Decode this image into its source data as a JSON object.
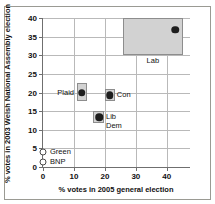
{
  "chart_data": {
    "type": "scatter",
    "title": "",
    "xlabel": "% votes in 2005 general election",
    "ylabel": "% votes in 2003 Welsh National Assembly election",
    "xlim": [
      0,
      47.5
    ],
    "ylim": [
      0,
      40
    ],
    "xticks": [
      "0",
      "10",
      "20",
      "30",
      "40"
    ],
    "xtick_values": [
      0,
      10,
      20,
      30,
      40
    ],
    "yticks": [
      "0",
      "5",
      "10",
      "15",
      "20",
      "25",
      "30",
      "35",
      "40"
    ],
    "ytick_values": [
      0,
      5,
      10,
      15,
      20,
      25,
      30,
      35,
      40
    ],
    "grid": "horizontal-and-vertical",
    "legend": "none",
    "points": [
      {
        "name": "Lab",
        "label": "Lab",
        "x": 42.7,
        "y": 36.9,
        "marker": "filled-circle",
        "band": {
          "x0": 25.8,
          "x1": 45.2,
          "y0": 30.0,
          "y1": 40.0
        },
        "label_pos": "below-band"
      },
      {
        "name": "Plaid",
        "label": "Plaid",
        "x": 12.6,
        "y": 20.0,
        "marker": "filled-circle",
        "band": {
          "x0": 10.9,
          "x1": 14.3,
          "y0": 17.6,
          "y1": 22.6
        },
        "label_pos": "left"
      },
      {
        "name": "Con",
        "label": "Con",
        "x": 21.6,
        "y": 19.3,
        "marker": "filled-circle",
        "band": {
          "x0": 20.0,
          "x1": 23.3,
          "y0": 17.6,
          "y1": 21.0
        },
        "label_pos": "right"
      },
      {
        "name": "Lib Dem",
        "label": "Lib\nDem",
        "label_line1": "Lib",
        "label_line2": "Dem",
        "x": 18.1,
        "y": 13.4,
        "marker": "filled-circle",
        "band": {
          "x0": 16.3,
          "x1": 19.8,
          "y0": 11.7,
          "y1": 15.1
        },
        "label_pos": "right"
      },
      {
        "name": "Green",
        "label": "Green",
        "x": 0.0,
        "y": 4.0,
        "marker": "open-circle",
        "band": null,
        "label_pos": "right"
      },
      {
        "name": "BNP",
        "label": "BNP",
        "x": 0.0,
        "y": 1.4,
        "marker": "open-circle",
        "band": null,
        "label_pos": "right"
      }
    ],
    "colors": {
      "band_fill": "#d2d2d2",
      "band_stroke": "#8d8d8d",
      "dot": "#1d1d1d",
      "grid": "#b9b9b9",
      "axis": "#6f6f6f",
      "frame": "#9a9a93",
      "background": "#ffffff"
    }
  }
}
